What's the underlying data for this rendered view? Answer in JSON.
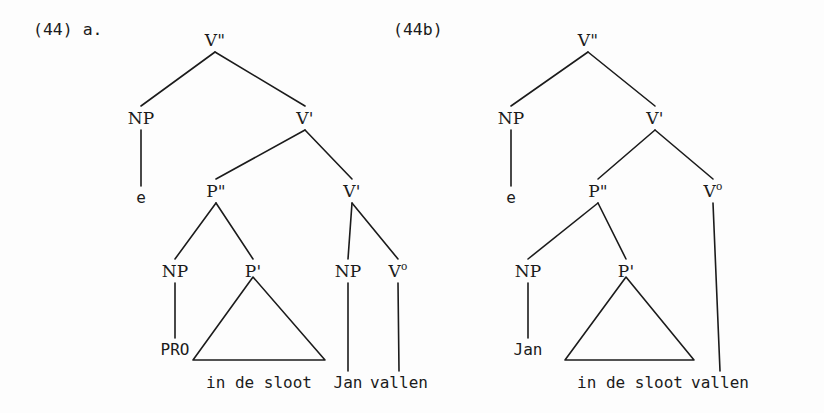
{
  "figure": {
    "kind": "syntax-tree-pair",
    "background_color": "#fdfdfd",
    "ink_color": "#1b1b1b"
  },
  "examples": [
    {
      "id": "left",
      "number_label": "(44) a."
    },
    {
      "id": "right",
      "number_label": "(44b)"
    }
  ],
  "trees": {
    "left": {
      "example_label": "(44) a.",
      "nodes": [
        {
          "key": "vmax",
          "label": "V\"",
          "x": 215,
          "y": 32,
          "type": "category"
        },
        {
          "key": "np1",
          "label": "NP",
          "x": 141,
          "y": 110,
          "type": "category"
        },
        {
          "key": "e",
          "label": "e",
          "x": 141,
          "y": 190,
          "type": "terminal"
        },
        {
          "key": "vbar1",
          "label": "V'",
          "x": 305,
          "y": 110,
          "type": "category"
        },
        {
          "key": "pmax",
          "label": "P\"",
          "x": 216,
          "y": 183,
          "type": "category"
        },
        {
          "key": "vbar2",
          "label": "V'",
          "x": 352,
          "y": 183,
          "type": "category"
        },
        {
          "key": "np2",
          "label": "NP",
          "x": 175,
          "y": 263,
          "type": "category"
        },
        {
          "key": "pbar",
          "label": "P'",
          "x": 253,
          "y": 263,
          "type": "category"
        },
        {
          "key": "pro",
          "label": "PRO",
          "x": 175,
          "y": 342,
          "type": "terminal"
        },
        {
          "key": "np3",
          "label": "NP",
          "x": 348,
          "y": 263,
          "type": "category"
        },
        {
          "key": "vzero",
          "label": "V",
          "x": 398,
          "y": 263,
          "type": "category",
          "superscript": "o"
        }
      ],
      "terminals": [
        {
          "key": "t_indesloot",
          "label": "in de sloot",
          "x": 259,
          "y": 375
        },
        {
          "key": "t_jan",
          "label": "Jan",
          "x": 348,
          "y": 375
        },
        {
          "key": "t_vallen",
          "label": "vallen",
          "x": 399,
          "y": 375
        }
      ],
      "triangle": {
        "apex_x": 253,
        "apex_y": 277,
        "left_x": 193,
        "right_x": 325,
        "base_y": 360
      },
      "edges": [
        [
          "vmax",
          "np1"
        ],
        [
          "vmax",
          "vbar1"
        ],
        [
          "np1",
          "e"
        ],
        [
          "vbar1",
          "pmax"
        ],
        [
          "vbar1",
          "vbar2"
        ],
        [
          "pmax",
          "np2"
        ],
        [
          "pmax",
          "pbar"
        ],
        [
          "np2",
          "pro"
        ],
        [
          "vbar2",
          "np3"
        ],
        [
          "vbar2",
          "vzero"
        ],
        [
          "np3",
          "t_jan"
        ],
        [
          "vzero",
          "t_vallen"
        ]
      ]
    },
    "right": {
      "example_label": "(44b)",
      "nodes": [
        {
          "key": "vmax",
          "label": "V\"",
          "x": 588,
          "y": 32,
          "type": "category"
        },
        {
          "key": "np1",
          "label": "NP",
          "x": 511,
          "y": 110,
          "type": "category"
        },
        {
          "key": "e",
          "label": "e",
          "x": 511,
          "y": 190,
          "type": "terminal"
        },
        {
          "key": "vbar1",
          "label": "V'",
          "x": 655,
          "y": 110,
          "type": "category"
        },
        {
          "key": "pmax",
          "label": "P\"",
          "x": 598,
          "y": 183,
          "type": "category"
        },
        {
          "key": "vzero",
          "label": "V",
          "x": 713,
          "y": 183,
          "type": "category",
          "superscript": "o"
        },
        {
          "key": "np2",
          "label": "NP",
          "x": 528,
          "y": 263,
          "type": "category"
        },
        {
          "key": "pbar",
          "label": "P'",
          "x": 626,
          "y": 263,
          "type": "category"
        },
        {
          "key": "jan",
          "label": "Jan",
          "x": 528,
          "y": 342,
          "type": "terminal"
        }
      ],
      "terminals": [
        {
          "key": "t_indesloot",
          "label": "in de sloot",
          "x": 630,
          "y": 375
        },
        {
          "key": "t_vallen",
          "label": "vallen",
          "x": 720,
          "y": 375
        }
      ],
      "triangle": {
        "apex_x": 626,
        "apex_y": 277,
        "left_x": 565,
        "right_x": 694,
        "base_y": 360
      },
      "edges": [
        [
          "vmax",
          "np1"
        ],
        [
          "vmax",
          "vbar1"
        ],
        [
          "np1",
          "e"
        ],
        [
          "vbar1",
          "pmax"
        ],
        [
          "vbar1",
          "vzero"
        ],
        [
          "pmax",
          "np2"
        ],
        [
          "pmax",
          "pbar"
        ],
        [
          "np2",
          "jan"
        ],
        [
          "vzero",
          "t_vallen"
        ]
      ]
    }
  },
  "example_label_positions": {
    "left": {
      "x": 33,
      "y": 22
    },
    "right": {
      "x": 393,
      "y": 22
    }
  }
}
